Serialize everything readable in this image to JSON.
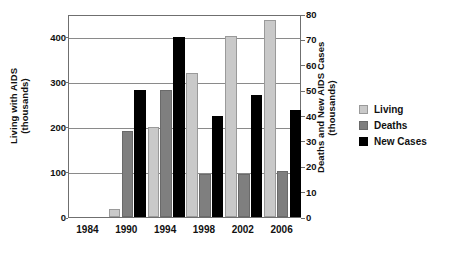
{
  "chart_data": {
    "type": "bar",
    "title": "",
    "xlabel": "",
    "grid": true,
    "legend_position": "right",
    "categories": [
      "1984",
      "1990",
      "1994",
      "1998",
      "2002",
      "2006"
    ],
    "series": [
      {
        "name": "Living",
        "axis": "left",
        "color": "#c9c9c9",
        "values": [
          0,
          18,
          200,
          320,
          402,
          437
        ]
      },
      {
        "name": "Deaths",
        "axis": "right",
        "color": "#7f7f7f",
        "values": [
          0,
          34,
          50,
          17,
          17,
          18
        ]
      },
      {
        "name": "New Cases",
        "axis": "right",
        "color": "#000000",
        "values": [
          0,
          50,
          71,
          40,
          48,
          42
        ]
      }
    ],
    "left_axis": {
      "label": "Living with AIDS",
      "label_line2": "(thousands)",
      "ylim": [
        0,
        450
      ],
      "ticks": [
        0,
        100,
        200,
        300,
        400
      ],
      "tick_labels": [
        "0",
        "100",
        "200",
        "300",
        "400"
      ]
    },
    "right_axis": {
      "label": "Deaths and New AIDS Cases",
      "label_line2": "(thousands)",
      "ylim": [
        0,
        80
      ],
      "ticks": [
        0,
        10,
        20,
        30,
        40,
        50,
        60,
        70,
        80
      ],
      "tick_labels": [
        "0",
        "10",
        "20",
        "30",
        "40",
        "50",
        "60",
        "70",
        "80"
      ]
    },
    "legend": [
      {
        "label": "Living",
        "color": "#c9c9c9"
      },
      {
        "label": "Deaths",
        "color": "#7f7f7f"
      },
      {
        "label": "New Cases",
        "color": "#000000"
      }
    ]
  }
}
